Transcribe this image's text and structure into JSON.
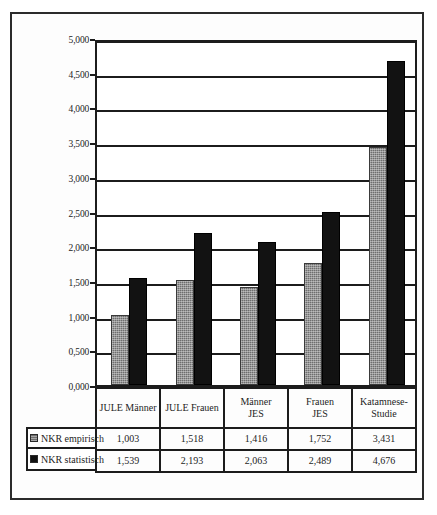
{
  "chart_data": {
    "type": "bar",
    "title": "",
    "subtitle": "",
    "xlabel": "",
    "ylabel": "",
    "ylim": [
      0,
      5
    ],
    "ytick_step": 0.5,
    "grid": true,
    "legend_position": "table-left",
    "categories": [
      "JULE Männer",
      "JULE Frauen",
      "Männer\nJES",
      "Frauen\nJES",
      "Katamnese-\nStudie"
    ],
    "ytick_labels": [
      "5,000",
      "4,500",
      "4,000",
      "3,500",
      "3,000",
      "2,500",
      "2,000",
      "1,500",
      "1,000",
      "0,500",
      "0,000"
    ],
    "ytick_values": [
      5.0,
      4.5,
      4.0,
      3.5,
      3.0,
      2.5,
      2.0,
      1.5,
      1.0,
      0.5,
      0.0
    ],
    "series": [
      {
        "name": "NKR empirisch",
        "color": "#6e6e6e",
        "values": [
          1.003,
          1.518,
          1.416,
          1.752,
          3.431
        ],
        "labels": [
          "1,003",
          "1,518",
          "1,416",
          "1,752",
          "3,431"
        ]
      },
      {
        "name": "NKR statistisch",
        "color": "#121212",
        "values": [
          1.539,
          2.193,
          2.063,
          2.489,
          4.676
        ],
        "labels": [
          "1,539",
          "2,193",
          "2,063",
          "2,489",
          "4,676"
        ]
      }
    ]
  },
  "data_table": {
    "category_row": [
      "JULE Männer",
      "JULE Frauen",
      "Männer JES",
      "Frauen JES",
      "Katamnese- Studie"
    ],
    "rows": [
      {
        "label": "NKR empirisch",
        "swatch": "empirisch",
        "values": [
          "1,003",
          "1,518",
          "1,416",
          "1,752",
          "3,431"
        ]
      },
      {
        "label": "NKR statistisch",
        "swatch": "statistisch",
        "values": [
          "1,539",
          "2,193",
          "2,063",
          "2,489",
          "4,676"
        ]
      }
    ]
  }
}
